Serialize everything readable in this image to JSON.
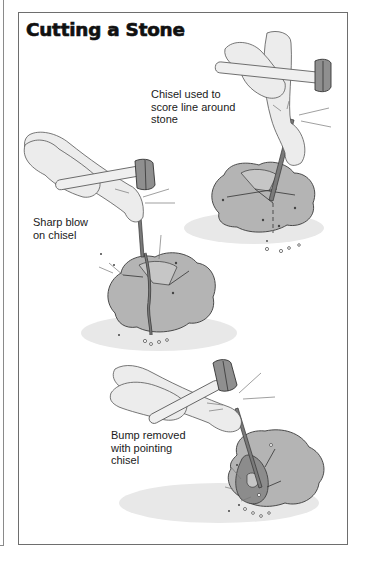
{
  "document": {
    "title": "Cutting a Stone",
    "figures": [
      {
        "id": "score",
        "caption_lines": [
          "Chisel used to",
          "score line around",
          "stone"
        ]
      },
      {
        "id": "split",
        "caption_lines": [
          "Sharp blow",
          "on chisel"
        ]
      },
      {
        "id": "bump",
        "caption_lines": [
          "Bump removed",
          "with pointing",
          "chisel"
        ]
      }
    ]
  },
  "colors": {
    "border": "#6e6e6e",
    "stone": "#b4b4b4",
    "stone_dark": "#8c8c8c",
    "skin": "#ececec",
    "hammer_head": "#8f8f8f",
    "shadow": "#e6e6e6",
    "text": "#1a1a1a"
  }
}
